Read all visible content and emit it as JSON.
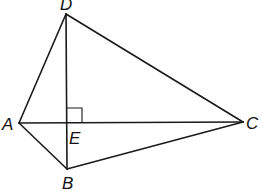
{
  "diagram": {
    "type": "geometry",
    "points": {
      "A": {
        "label": "A",
        "x": 19,
        "y": 123
      },
      "B": {
        "label": "B",
        "x": 67,
        "y": 169
      },
      "C": {
        "label": "C",
        "x": 243,
        "y": 122
      },
      "D": {
        "label": "D",
        "x": 66,
        "y": 14
      },
      "E": {
        "label": "E",
        "x": 67,
        "y": 123
      }
    },
    "segments": [
      "AD",
      "DC",
      "CB",
      "BA",
      "AC",
      "DB"
    ],
    "right_angle_at": "E",
    "labels": {
      "A": "A",
      "B": "B",
      "C": "C",
      "D": "D",
      "E": "E"
    }
  }
}
